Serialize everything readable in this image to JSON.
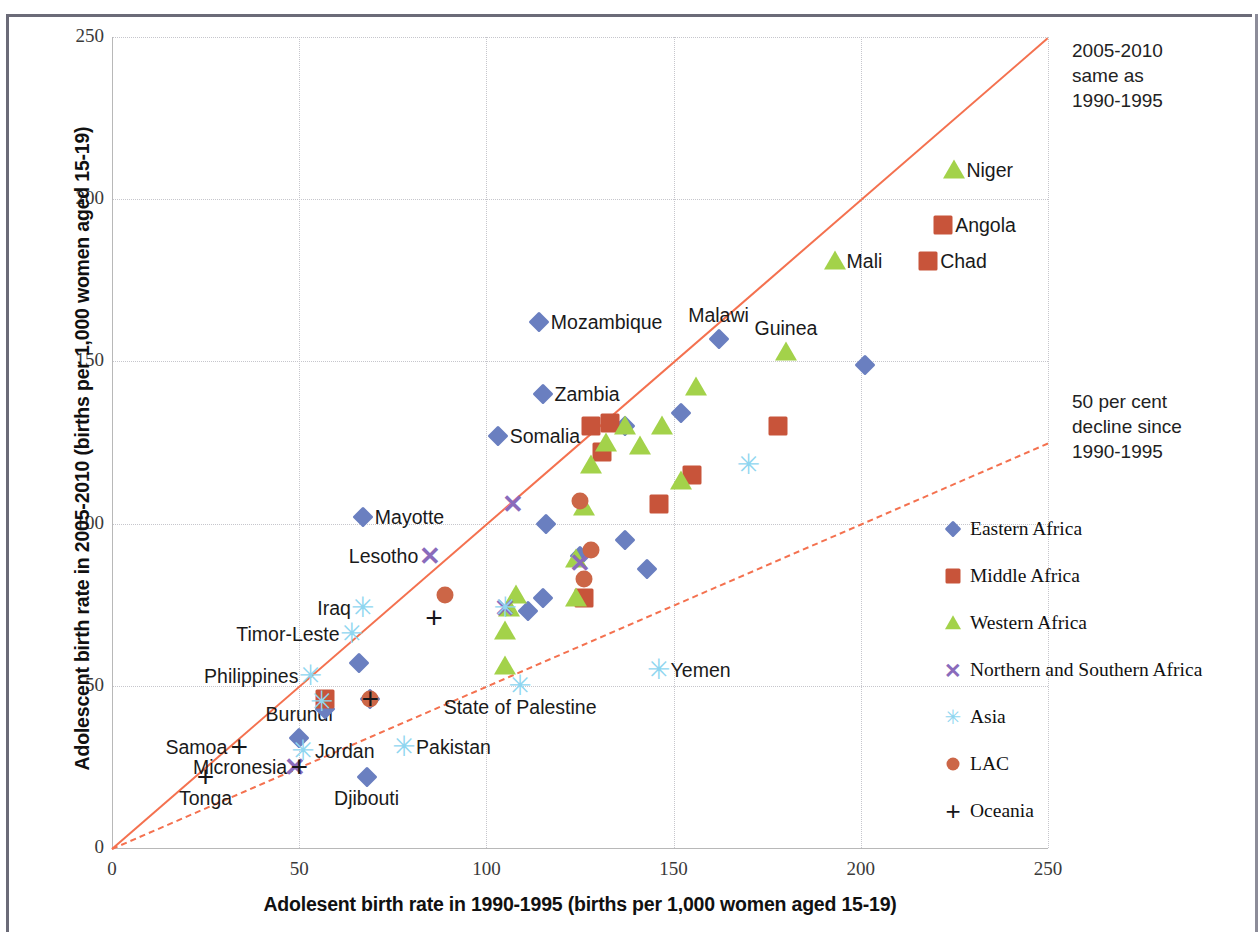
{
  "chart_data": {
    "type": "scatter",
    "title": "",
    "xlabel": "Adolesent birth rate in 1990-1995 (births per 1,000 women aged 15-19)",
    "ylabel": "Adolescent birth rate in 2005-2010 (births per 1,000 women aged 15-19)",
    "xlim": [
      0,
      250
    ],
    "ylim": [
      0,
      250
    ],
    "xticks": [
      0,
      50,
      100,
      150,
      200,
      250
    ],
    "yticks": [
      0,
      50,
      100,
      150,
      200,
      250
    ],
    "grid": true,
    "legend_position": "right",
    "reference_lines": [
      {
        "name": "same-as-line",
        "style": "solid",
        "color": "#f4714f",
        "slope": 1.0,
        "annotation": [
          "2005-2010",
          "same as",
          "1990-1995"
        ]
      },
      {
        "name": "fifty-per-cent-decline-line",
        "style": "dashed",
        "color": "#f4714f",
        "slope": 0.5,
        "annotation": [
          "50 per cent",
          "decline since",
          "1990-1995"
        ]
      }
    ],
    "series": [
      {
        "name": "Eastern Africa",
        "marker": "diamond",
        "color": "#6a7fc0",
        "points": [
          {
            "label": "Mozambique",
            "x": 114,
            "y": 162,
            "label_pos": "right"
          },
          {
            "label": "Zambia",
            "x": 115,
            "y": 140,
            "label_pos": "right"
          },
          {
            "label": "Somalia",
            "x": 103,
            "y": 127,
            "label_pos": "right"
          },
          {
            "label": "Malawi",
            "x": 162,
            "y": 157,
            "label_pos": "above"
          },
          {
            "label": "Mayotte",
            "x": 67,
            "y": 102,
            "label_pos": "right"
          },
          {
            "label": "Burundi",
            "x": 50,
            "y": 34,
            "label_pos": "above"
          },
          {
            "label": "Djibouti",
            "x": 68,
            "y": 22,
            "label_pos": "below"
          },
          {
            "label": "",
            "x": 201,
            "y": 149
          },
          {
            "label": "",
            "x": 137,
            "y": 130
          },
          {
            "label": "",
            "x": 152,
            "y": 134
          },
          {
            "label": "",
            "x": 116,
            "y": 100
          },
          {
            "label": "",
            "x": 125,
            "y": 90
          },
          {
            "label": "",
            "x": 137,
            "y": 95
          },
          {
            "label": "",
            "x": 143,
            "y": 86
          },
          {
            "label": "",
            "x": 115,
            "y": 77
          },
          {
            "label": "",
            "x": 111,
            "y": 73
          },
          {
            "label": "",
            "x": 66,
            "y": 57
          },
          {
            "label": "",
            "x": 57,
            "y": 43
          },
          {
            "label": "",
            "x": 69,
            "y": 46
          }
        ]
      },
      {
        "name": "Middle Africa",
        "marker": "square",
        "color": "#c8543a",
        "points": [
          {
            "label": "Angola",
            "x": 222,
            "y": 192,
            "label_pos": "right"
          },
          {
            "label": "Chad",
            "x": 218,
            "y": 181,
            "label_pos": "right"
          },
          {
            "label": "",
            "x": 128,
            "y": 130
          },
          {
            "label": "",
            "x": 133,
            "y": 131
          },
          {
            "label": "",
            "x": 131,
            "y": 122
          },
          {
            "label": "",
            "x": 178,
            "y": 130
          },
          {
            "label": "",
            "x": 155,
            "y": 115
          },
          {
            "label": "",
            "x": 146,
            "y": 106
          },
          {
            "label": "",
            "x": 126,
            "y": 77
          },
          {
            "label": "",
            "x": 57,
            "y": 46
          }
        ]
      },
      {
        "name": "Western Africa",
        "marker": "triangle",
        "color": "#a3d24a",
        "points": [
          {
            "label": "Niger",
            "x": 225,
            "y": 209,
            "label_pos": "right"
          },
          {
            "label": "Mali",
            "x": 193,
            "y": 181,
            "label_pos": "right"
          },
          {
            "label": "Guinea",
            "x": 180,
            "y": 153,
            "label_pos": "above"
          },
          {
            "label": "",
            "x": 156,
            "y": 142
          },
          {
            "label": "",
            "x": 137,
            "y": 130
          },
          {
            "label": "",
            "x": 132,
            "y": 125
          },
          {
            "label": "",
            "x": 141,
            "y": 124
          },
          {
            "label": "",
            "x": 147,
            "y": 130
          },
          {
            "label": "",
            "x": 152,
            "y": 113
          },
          {
            "label": "",
            "x": 128,
            "y": 118
          },
          {
            "label": "",
            "x": 126,
            "y": 105
          },
          {
            "label": "",
            "x": 124,
            "y": 89
          },
          {
            "label": "",
            "x": 124,
            "y": 77
          },
          {
            "label": "",
            "x": 106,
            "y": 74
          },
          {
            "label": "",
            "x": 105,
            "y": 67
          },
          {
            "label": "",
            "x": 105,
            "y": 56
          },
          {
            "label": "",
            "x": 108,
            "y": 78
          }
        ]
      },
      {
        "name": "Northern and Southern Africa",
        "marker": "x",
        "color": "#8a6bbb",
        "points": [
          {
            "label": "Lesotho",
            "x": 85,
            "y": 90,
            "label_pos": "left"
          },
          {
            "label": "",
            "x": 107,
            "y": 106
          },
          {
            "label": "",
            "x": 125,
            "y": 88
          },
          {
            "label": "",
            "x": 105,
            "y": 74
          },
          {
            "label": "",
            "x": 49,
            "y": 25
          }
        ]
      },
      {
        "name": "Asia",
        "marker": "star",
        "color": "#8fd6f0",
        "points": [
          {
            "label": "Yemen",
            "x": 146,
            "y": 55,
            "label_pos": "right"
          },
          {
            "label": "State of Palestine",
            "x": 109,
            "y": 50,
            "label_pos": "below"
          },
          {
            "label": "Iraq",
            "x": 67,
            "y": 74,
            "label_pos": "left"
          },
          {
            "label": "Timor-Leste",
            "x": 64,
            "y": 66,
            "label_pos": "left"
          },
          {
            "label": "Philippines",
            "x": 53,
            "y": 53,
            "label_pos": "left"
          },
          {
            "label": "Pakistan",
            "x": 78,
            "y": 31,
            "label_pos": "right"
          },
          {
            "label": "Jordan",
            "x": 51,
            "y": 30,
            "label_pos": "right"
          },
          {
            "label": "",
            "x": 170,
            "y": 118
          },
          {
            "label": "",
            "x": 56,
            "y": 45
          },
          {
            "label": "",
            "x": 105,
            "y": 74
          }
        ]
      },
      {
        "name": "LAC",
        "marker": "circle",
        "color": "#cc6647",
        "points": [
          {
            "label": "",
            "x": 89,
            "y": 78
          },
          {
            "label": "",
            "x": 125,
            "y": 107
          },
          {
            "label": "",
            "x": 128,
            "y": 92
          },
          {
            "label": "",
            "x": 126,
            "y": 83
          },
          {
            "label": "",
            "x": 69,
            "y": 46
          }
        ]
      },
      {
        "name": "Oceania",
        "marker": "plus",
        "color": "#16161a",
        "points": [
          {
            "label": "Samoa",
            "x": 34,
            "y": 31,
            "label_pos": "left"
          },
          {
            "label": "Tonga",
            "x": 25,
            "y": 22,
            "label_pos": "below"
          },
          {
            "label": "Micronesia",
            "x": 50,
            "y": 25,
            "label_pos": "left"
          },
          {
            "label": "",
            "x": 86,
            "y": 71
          },
          {
            "label": "",
            "x": 69,
            "y": 46
          }
        ]
      }
    ]
  },
  "legend": {
    "items": [
      {
        "label": "Eastern Africa",
        "marker": "diamond",
        "color": "#6a7fc0"
      },
      {
        "label": "Middle Africa",
        "marker": "square",
        "color": "#c8543a"
      },
      {
        "label": "Western Africa",
        "marker": "triangle",
        "color": "#a3d24a"
      },
      {
        "label": "Northern and Southern Africa",
        "marker": "x",
        "color": "#8a6bbb"
      },
      {
        "label": "Asia",
        "marker": "star",
        "color": "#8fd6f0"
      },
      {
        "label": "LAC",
        "marker": "circle",
        "color": "#cc6647"
      },
      {
        "label": "Oceania",
        "marker": "plus",
        "color": "#16161a"
      }
    ]
  },
  "annotations": {
    "same_as": {
      "line1": "2005-2010",
      "line2": "same as",
      "line3": "1990-1995"
    },
    "decline": {
      "line1": "50 per cent",
      "line2": "decline since",
      "line3": "1990-1995"
    }
  }
}
